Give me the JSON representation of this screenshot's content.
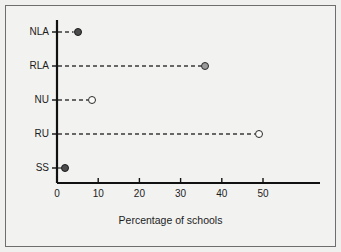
{
  "chart_data": {
    "type": "scatter",
    "title": "",
    "subtitle": "",
    "xlabel": "Percentage of schools",
    "ylabel": "",
    "categories": [
      "NLA",
      "RLA",
      "NU",
      "RU",
      "SS"
    ],
    "values": [
      5,
      36,
      8.5,
      49,
      2
    ],
    "points": [
      {
        "category": "NLA",
        "value": 5,
        "marker": "filled"
      },
      {
        "category": "RLA",
        "value": 36,
        "marker": "grey"
      },
      {
        "category": "NU",
        "value": 8.5,
        "marker": "open"
      },
      {
        "category": "RU",
        "value": 49,
        "marker": "open"
      },
      {
        "category": "SS",
        "value": 2,
        "marker": "filled"
      }
    ],
    "xticks": [
      0,
      10,
      20,
      30,
      40,
      50
    ],
    "xticklabels": [
      "0",
      "10",
      "20",
      "30",
      "40",
      "50"
    ],
    "xlim": [
      0,
      58
    ],
    "grid": false,
    "legend": "none",
    "leader_lines": "dashed",
    "colors": {
      "background": "#f2f2f0",
      "axis": "#111111",
      "marker_filled": "#4c4c4c",
      "marker_grey": "#9a9a9a",
      "marker_open": "#fbfbfa",
      "leader_line": "#3a3a3a",
      "border": "#6e6e6e"
    }
  },
  "axis": {
    "title": "Percentage of schools"
  },
  "ytick_labels": [
    "NLA",
    "RLA",
    "NU",
    "RU",
    "SS"
  ],
  "xtick_labels": [
    "0",
    "10",
    "20",
    "30",
    "40",
    "50"
  ]
}
